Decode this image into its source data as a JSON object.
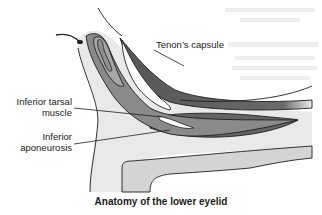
{
  "figure": {
    "title": "Anatomy of the lower eyelid",
    "labels": {
      "tenons_capsule": "Tenon’s capsule",
      "inferior_tarsal_line1": "Inferior tarsal",
      "inferior_tarsal_line2": "muscle",
      "inferior_aponeurosis_line1": "Inferior",
      "inferior_aponeurosis_line2": "aponeurosis"
    },
    "colors": {
      "skin": "#e8e8e8",
      "tarsus": "#9a9a9a",
      "muscle_dark": "#5a5a5a",
      "orbicularis": "#7d7d7d",
      "fat_light": "#dcdcdc",
      "outline": "#1e1e1e"
    }
  }
}
